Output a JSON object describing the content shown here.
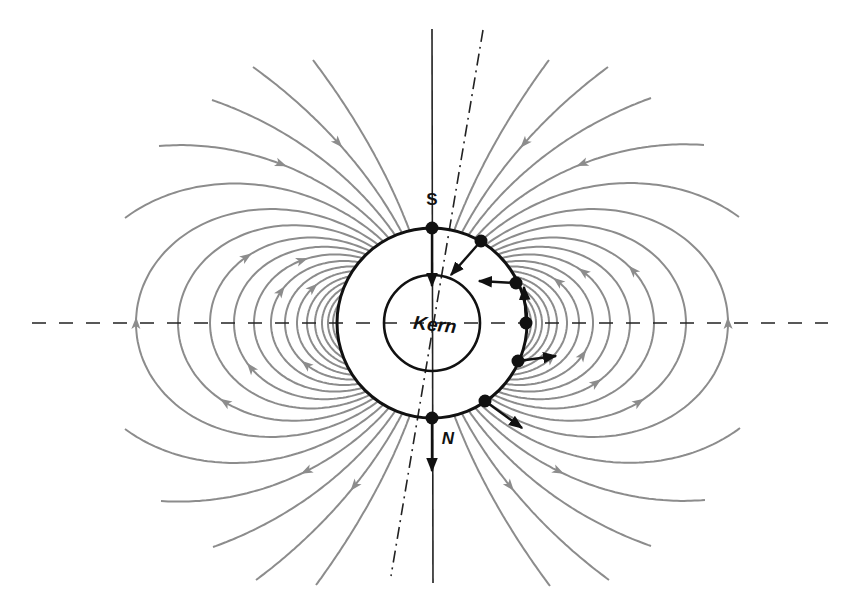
{
  "diagram": {
    "center": {
      "x": 432,
      "y": 323
    },
    "earth_radius": 95,
    "core_radius": 48,
    "colors": {
      "field_line": "#8c8c8c",
      "outline": "#111111",
      "axis": "#222222",
      "background": "#ffffff"
    },
    "labels": {
      "south_pole": "S",
      "north_pole": "N",
      "core": "Kern"
    },
    "label_positions": {
      "south_pole": {
        "x": 432,
        "y": 205
      },
      "north_pole": {
        "x": 448,
        "y": 444
      },
      "core": {
        "x": 435,
        "y": 331,
        "rotate": 6
      }
    },
    "axes": {
      "rotation_axis": {
        "x1": 432,
        "y1": 29,
        "x2": 433,
        "y2": 583,
        "style": "solid"
      },
      "magnetic_axis": {
        "x1": 483,
        "y1": 30,
        "x2": 391,
        "y2": 576,
        "style": "dash-dot"
      },
      "equator": {
        "x1": 32,
        "y1": 323,
        "x2": 828,
        "y2": 323,
        "style": "dashed"
      }
    },
    "closed_loop_L": [
      99,
      104,
      110,
      117,
      125,
      135,
      147,
      161,
      178,
      198,
      222,
      254,
      296
    ],
    "closed_loop_arrows": [
      {
        "side": "left",
        "L": 296,
        "t": 0.5
      },
      {
        "side": "left",
        "L": 254,
        "t": 0.3
      },
      {
        "side": "left",
        "L": 222,
        "t": 0.7
      },
      {
        "side": "left",
        "L": 198,
        "t": 0.35
      },
      {
        "side": "left",
        "L": 178,
        "t": 0.8
      },
      {
        "side": "left",
        "L": 161,
        "t": 0.65
      },
      {
        "side": "left",
        "L": 147,
        "t": 0.25
      },
      {
        "side": "left",
        "L": 135,
        "t": 0.75
      },
      {
        "side": "right",
        "L": 296,
        "t": 0.5
      },
      {
        "side": "right",
        "L": 254,
        "t": 0.3
      },
      {
        "side": "right",
        "L": 222,
        "t": 0.65
      },
      {
        "side": "right",
        "L": 198,
        "t": 0.28
      },
      {
        "side": "right",
        "L": 178,
        "t": 0.72
      },
      {
        "side": "right",
        "L": 161,
        "t": 0.35
      },
      {
        "side": "right",
        "L": 147,
        "t": 0.75
      },
      {
        "side": "right",
        "L": 135,
        "t": 0.25
      }
    ],
    "open_lines": [
      {
        "quadrant": "upper-left",
        "end": {
          "x": 313,
          "y": 60
        },
        "arrow": false
      },
      {
        "quadrant": "upper-left",
        "end": {
          "x": 253,
          "y": 67
        },
        "arrow": true
      },
      {
        "quadrant": "upper-left",
        "end": {
          "x": 212,
          "y": 100
        },
        "arrow": false
      },
      {
        "quadrant": "upper-left",
        "end": {
          "x": 159,
          "y": 146
        },
        "arrow": true
      },
      {
        "quadrant": "upper-left",
        "end": {
          "x": 125,
          "y": 218
        },
        "arrow": false
      },
      {
        "quadrant": "upper-right",
        "end": {
          "x": 549,
          "y": 60
        },
        "arrow": false
      },
      {
        "quadrant": "upper-right",
        "end": {
          "x": 608,
          "y": 67
        },
        "arrow": true
      },
      {
        "quadrant": "upper-right",
        "end": {
          "x": 651,
          "y": 98
        },
        "arrow": false
      },
      {
        "quadrant": "upper-right",
        "end": {
          "x": 704,
          "y": 145
        },
        "arrow": true
      },
      {
        "quadrant": "upper-right",
        "end": {
          "x": 739,
          "y": 217
        },
        "arrow": false
      },
      {
        "quadrant": "lower-left",
        "end": {
          "x": 316,
          "y": 585
        },
        "arrow": false
      },
      {
        "quadrant": "lower-left",
        "end": {
          "x": 256,
          "y": 580
        },
        "arrow": true
      },
      {
        "quadrant": "lower-left",
        "end": {
          "x": 213,
          "y": 547
        },
        "arrow": false
      },
      {
        "quadrant": "lower-left",
        "end": {
          "x": 161,
          "y": 501
        },
        "arrow": true
      },
      {
        "quadrant": "lower-left",
        "end": {
          "x": 125,
          "y": 429
        },
        "arrow": false
      },
      {
        "quadrant": "lower-right",
        "end": {
          "x": 550,
          "y": 586
        },
        "arrow": false
      },
      {
        "quadrant": "lower-right",
        "end": {
          "x": 609,
          "y": 580
        },
        "arrow": true
      },
      {
        "quadrant": "lower-right",
        "end": {
          "x": 651,
          "y": 546
        },
        "arrow": false
      },
      {
        "quadrant": "lower-right",
        "end": {
          "x": 705,
          "y": 500
        },
        "arrow": true
      },
      {
        "quadrant": "lower-right",
        "end": {
          "x": 740,
          "y": 428
        },
        "arrow": false
      }
    ],
    "surface_points": [
      {
        "name": "south-pole-point",
        "x": 432,
        "y": 228,
        "arrow_to": {
          "x": 432,
          "y": 286
        }
      },
      {
        "name": "upper-mid-latitude-point",
        "x": 481,
        "y": 241,
        "arrow_to": {
          "x": 451,
          "y": 275
        }
      },
      {
        "name": "upper-low-latitude-point",
        "x": 516,
        "y": 283,
        "arrow_to": {
          "x": 479,
          "y": 281
        }
      },
      {
        "name": "equator-point",
        "x": 526,
        "y": 323,
        "arrow_to": {
          "x": 524,
          "y": 287
        }
      },
      {
        "name": "lower-low-latitude-point",
        "x": 518,
        "y": 361,
        "arrow_to": {
          "x": 556,
          "y": 356
        }
      },
      {
        "name": "lower-mid-latitude-point",
        "x": 485,
        "y": 401,
        "arrow_to": {
          "x": 522,
          "y": 428
        }
      },
      {
        "name": "north-pole-point",
        "x": 432,
        "y": 418,
        "arrow_to": {
          "x": 432,
          "y": 471
        }
      }
    ]
  }
}
